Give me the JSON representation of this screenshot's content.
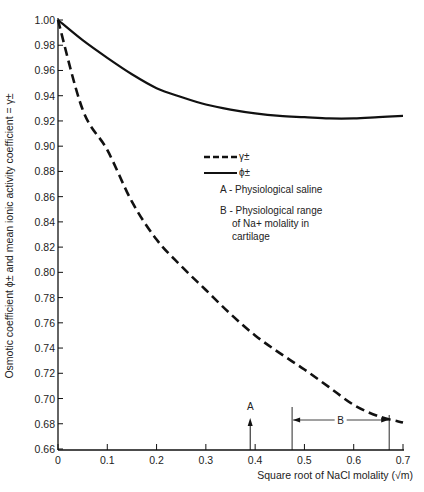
{
  "chart_data": {
    "type": "line",
    "title": "",
    "xlabel": "Square root of NaCl molality (√m)",
    "ylabel": "Osmotic coefficient ϕ± and mean ionic activity coefficient = γ±",
    "xlim": [
      0,
      0.7
    ],
    "ylim": [
      0.66,
      1.0
    ],
    "grid": false,
    "x_ticks": [
      "0",
      "0.1",
      "0.2",
      "0.3",
      "0.4",
      "0.5",
      "0.6",
      "0.7"
    ],
    "y_ticks": [
      "1.00",
      "0.98",
      "0.96",
      "0.94",
      "0.92",
      "0.90",
      "0.88",
      "0.86",
      "0.84",
      "0.82",
      "0.80",
      "0.78",
      "0.76",
      "0.74",
      "0.72",
      "0.70",
      "0.68",
      "0.66"
    ],
    "x": [
      0,
      0.05,
      0.1,
      0.15,
      0.2,
      0.25,
      0.3,
      0.35,
      0.4,
      0.45,
      0.5,
      0.55,
      0.6,
      0.65,
      0.7
    ],
    "series": [
      {
        "name": "γ±",
        "style": "dashed",
        "values": [
          1.0,
          0.929,
          0.897,
          0.856,
          0.826,
          0.805,
          0.786,
          0.767,
          0.75,
          0.736,
          0.723,
          0.709,
          0.695,
          0.686,
          0.681
        ]
      },
      {
        "name": "ϕ±",
        "style": "solid",
        "values": [
          1.0,
          0.984,
          0.97,
          0.957,
          0.946,
          0.939,
          0.933,
          0.929,
          0.926,
          0.924,
          0.923,
          0.922,
          0.922,
          0.923,
          0.924
        ]
      }
    ],
    "legend": {
      "position": "upper-center",
      "entries": [
        {
          "label": "γ±",
          "style": "dashed"
        },
        {
          "label": "ϕ±",
          "style": "solid"
        }
      ]
    },
    "annotations": [
      {
        "key": "A",
        "text": "A - Physiological saline",
        "x": 0.39
      },
      {
        "key": "B",
        "lines": [
          "B - Physiological range",
          "of Na+ molality in",
          "cartilage"
        ],
        "x_range": [
          0.475,
          0.672
        ]
      }
    ]
  }
}
